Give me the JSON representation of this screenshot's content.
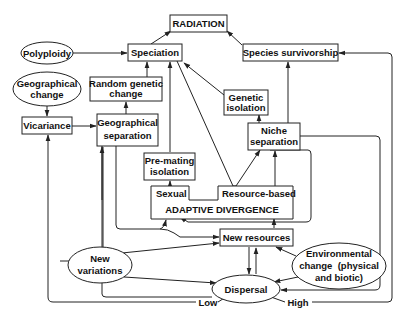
{
  "diagram": {
    "nodes": {
      "radiation": "RADIATION",
      "polyploidy": "Polyploidy",
      "speciation": "Speciation",
      "species_survivorship": "Species survivorship",
      "geographical_change": [
        "Geographical",
        "change"
      ],
      "random_genetic_change": [
        "Random genetic",
        "change"
      ],
      "vicariance": "Vicariance",
      "geographical_separation": [
        "Geographical",
        "separation"
      ],
      "genetic_isolation": [
        "Genetic",
        "isolation"
      ],
      "niche_separation": [
        "Niche",
        "separation"
      ],
      "pre_mating_isolation": [
        "Pre-mating",
        "isolation"
      ],
      "sexual": "Sexual",
      "resource_based": "Resource-based",
      "adaptive_divergence": "ADAPTIVE DIVERGENCE",
      "new_resources": "New resources",
      "new_variations": [
        "New",
        "variations"
      ],
      "environmental_change": [
        "Environmental",
        "change  (physical",
        "and biotic)"
      ],
      "dispersal": "Dispersal",
      "low": "Low",
      "high": "High"
    },
    "edges": [
      {
        "from": "Speciation",
        "to": "RADIATION"
      },
      {
        "from": "Species survivorship",
        "to": "RADIATION"
      },
      {
        "from": "Polyploidy",
        "to": "Speciation"
      },
      {
        "from": "Random genetic change",
        "to": "Speciation"
      },
      {
        "from": "Pre-mating isolation",
        "to": "Speciation"
      },
      {
        "from": "Genetic isolation",
        "to": "Speciation"
      },
      {
        "from": "Geographical change",
        "to": "Vicariance"
      },
      {
        "from": "Vicariance",
        "to": "Geographical separation"
      },
      {
        "from": "Geographical separation",
        "to": "Random genetic change"
      },
      {
        "from": "Niche separation",
        "to": "Genetic isolation"
      },
      {
        "from": "Niche separation",
        "to": "Species survivorship"
      },
      {
        "from": "Resource-based",
        "to": "Niche separation"
      },
      {
        "from": "Speciation",
        "to": "Niche separation"
      },
      {
        "from": "Sexual",
        "to": "Pre-mating isolation"
      },
      {
        "from": "New resources",
        "to": "ADAPTIVE DIVERGENCE"
      },
      {
        "from": "New variations",
        "to": "New resources"
      },
      {
        "from": "Environmental change",
        "to": "New resources"
      },
      {
        "from": "New resources",
        "to": "Dispersal"
      },
      {
        "from": "Dispersal",
        "to": "New resources"
      },
      {
        "from": "New variations",
        "to": "Dispersal"
      },
      {
        "from": "Environmental change",
        "to": "Dispersal"
      },
      {
        "from": "Niche separation",
        "to": "Dispersal"
      },
      {
        "from": "Dispersal (Low)",
        "to": "Vicariance"
      },
      {
        "from": "Dispersal (High)",
        "to": "Species survivorship"
      }
    ]
  }
}
